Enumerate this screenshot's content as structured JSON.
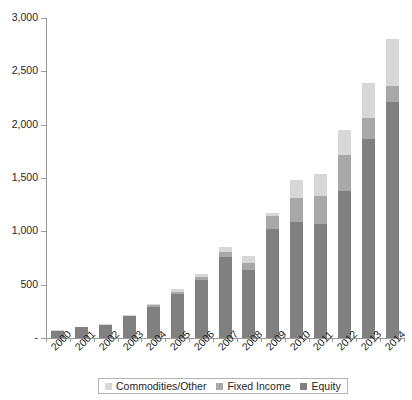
{
  "chart_data": {
    "type": "bar",
    "subtype": "stacked-bar",
    "title": "",
    "xlabel": "",
    "ylabel": "",
    "categories": [
      "2000",
      "2001",
      "2002",
      "2003",
      "2004",
      "2005",
      "2006",
      "2007",
      "2008",
      "2009",
      "2010",
      "2011",
      "2012",
      "2013",
      "2014"
    ],
    "series": [
      {
        "name": "Equity",
        "color": "#808080",
        "values": [
          70,
          100,
          125,
          205,
          295,
          415,
          545,
          760,
          640,
          1020,
          1090,
          1070,
          1380,
          1870,
          2210
        ]
      },
      {
        "name": "Fixed Income",
        "color": "#a8a8a8",
        "values": [
          0,
          0,
          0,
          5,
          10,
          15,
          25,
          50,
          65,
          120,
          220,
          260,
          340,
          190,
          155
        ]
      },
      {
        "name": "Commodities/Other",
        "color": "#d7d7d7",
        "values": [
          5,
          5,
          10,
          10,
          15,
          25,
          30,
          45,
          65,
          35,
          175,
          205,
          230,
          330,
          440
        ]
      }
    ],
    "totals": [
      75,
      105,
      135,
      220,
      320,
      455,
      600,
      855,
      770,
      1175,
      1485,
      1535,
      1950,
      2390,
      2805
    ],
    "stack_order_bottom_to_top": [
      "Equity",
      "Fixed Income",
      "Commodities/Other"
    ],
    "ylim": [
      0,
      3000
    ],
    "yticks": [
      0,
      500,
      1000,
      1500,
      2000,
      2500,
      3000
    ],
    "ytick_labels": [
      "-",
      "500",
      "1,000",
      "1,500",
      "2,000",
      "2,500",
      "3,000"
    ],
    "grid": false,
    "legend_position": "bottom"
  },
  "legend": {
    "items": [
      {
        "label": "Commodities/Other",
        "color": "#d7d7d7"
      },
      {
        "label": "Fixed Income",
        "color": "#a8a8a8"
      },
      {
        "label": "Equity",
        "color": "#808080"
      }
    ]
  }
}
